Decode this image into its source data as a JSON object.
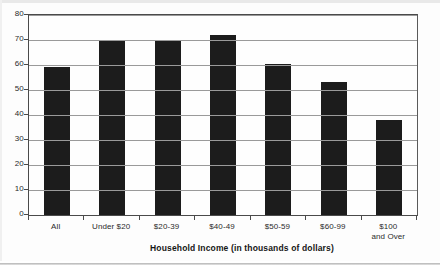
{
  "chart_data": {
    "type": "bar",
    "title": "",
    "xlabel": "Household Income (in thousands of dollars)",
    "ylabel": "",
    "categories": [
      "All",
      "Under $20",
      "$20-39",
      "$40-49",
      "$50-59",
      "$60-99",
      "$100 and Over"
    ],
    "category_lines": [
      [
        "All"
      ],
      [
        "Under $20"
      ],
      [
        "$20-39"
      ],
      [
        "$40-49"
      ],
      [
        "$50-59"
      ],
      [
        "$60-99"
      ],
      [
        "$100",
        "and Over"
      ]
    ],
    "values": [
      59,
      69.5,
      70,
      72,
      60.5,
      53,
      38
    ],
    "ylim": [
      0,
      80
    ],
    "ytick_step": 10,
    "yticks": [
      80,
      70,
      60,
      50,
      40,
      30,
      20,
      10,
      0
    ],
    "grid": true,
    "legend": false,
    "bar_color": "#1c1c1c",
    "grid_color": "#9a9a9a",
    "axis_color": "#4a4a4a",
    "background": "#fefefe"
  },
  "axis": {
    "y_labels": [
      "80",
      "70",
      "60",
      "50",
      "40",
      "30",
      "20",
      "10",
      "0"
    ],
    "x_title": "Household Income (in thousands of dollars)"
  }
}
